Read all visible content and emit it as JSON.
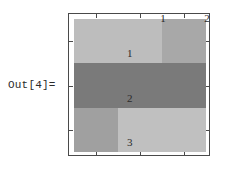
{
  "prompt": {
    "out_label": "Out[4]="
  },
  "chart_data": {
    "type": "heatmap",
    "title": "",
    "subtitle": "",
    "xlabel": "",
    "ylabel": "",
    "grid": false,
    "legend": null,
    "colormap": "GrayLevel",
    "rows": 3,
    "columns": 3,
    "x_tick_labels": [
      "1",
      "2",
      "3"
    ],
    "y_tick_labels": [
      "1",
      "2",
      "3"
    ],
    "top_tick_labels": [
      "1",
      "2",
      "3"
    ],
    "right_tick_labels": [
      "1",
      "2",
      "3"
    ],
    "bottom_tick_labels": [
      "1",
      "2",
      "3"
    ],
    "left_tick_labels": [
      "1",
      "2",
      "3"
    ],
    "values": [
      [
        0.74,
        0.74,
        0.66
      ],
      [
        0.48,
        0.48,
        0.48
      ],
      [
        0.63,
        0.75,
        0.75
      ]
    ],
    "cell_colors": [
      [
        "#bdbdbd",
        "#bdbdbd",
        "#a8a8a8"
      ],
      [
        "#7a7a7a",
        "#7a7a7a",
        "#7a7a7a"
      ],
      [
        "#a0a0a0",
        "#c0c0c0",
        "#c0c0c0"
      ]
    ],
    "frame_color": "#4a4a4a",
    "background_color": "#ffffff",
    "text_color": "#2b2b2b"
  }
}
